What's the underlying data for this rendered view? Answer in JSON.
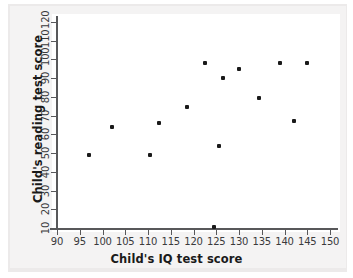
{
  "chart_data": {
    "type": "scatter",
    "title": "",
    "xlabel": "Child's IQ test score",
    "ylabel": "Child's reading test score",
    "xlim": [
      90,
      150
    ],
    "ylim": [
      10,
      120
    ],
    "xticks": [
      90,
      95,
      100,
      105,
      110,
      115,
      120,
      125,
      130,
      135,
      140,
      145,
      150
    ],
    "yticks": [
      10,
      20,
      30,
      40,
      50,
      60,
      70,
      80,
      90,
      100,
      110,
      120
    ],
    "grid": false,
    "legend": null,
    "marker_color": "#1a1a1a",
    "points": [
      {
        "x": 97.0,
        "y": 49.0
      },
      {
        "x": 102.0,
        "y": 64.0
      },
      {
        "x": 110.5,
        "y": 49.0
      },
      {
        "x": 112.5,
        "y": 66.0
      },
      {
        "x": 118.5,
        "y": 74.5
      },
      {
        "x": 122.5,
        "y": 98.0
      },
      {
        "x": 124.5,
        "y": 10.5
      },
      {
        "x": 125.5,
        "y": 54.0
      },
      {
        "x": 126.5,
        "y": 90.0
      },
      {
        "x": 130.0,
        "y": 95.0
      },
      {
        "x": 134.5,
        "y": 79.5
      },
      {
        "x": 139.0,
        "y": 98.0
      },
      {
        "x": 142.0,
        "y": 67.0
      },
      {
        "x": 145.0,
        "y": 98.0
      }
    ]
  },
  "colors": {
    "axis": "#58585a",
    "text": "#1a1a1a",
    "tick_text": "#3a3a3c",
    "backdrop": "#eceaea",
    "canvas": "#ffffff"
  }
}
